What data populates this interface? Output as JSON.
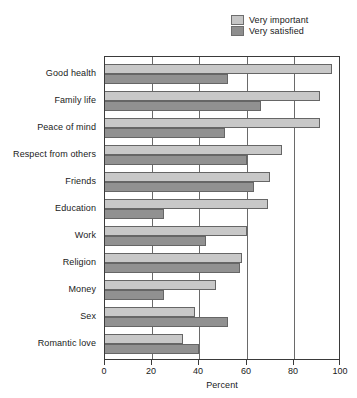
{
  "chart_data": {
    "type": "bar",
    "orientation": "horizontal",
    "title": "",
    "xlabel": "Percent",
    "ylabel": "",
    "xlim": [
      0,
      100
    ],
    "xticks": [
      0,
      20,
      40,
      60,
      80,
      100
    ],
    "xtick_labels": [
      "0",
      "20",
      "40",
      "60",
      "80",
      "100"
    ],
    "grid": true,
    "grid_axis": "x",
    "legend_position": "top-right",
    "categories": [
      "Good health",
      "Family life",
      "Peace of mind",
      "Respect from others",
      "Friends",
      "Education",
      "Work",
      "Religion",
      "Money",
      "Sex",
      "Romantic love"
    ],
    "series": [
      {
        "name": "Very important",
        "color": "#c8c8c8",
        "values": [
          96,
          91,
          91,
          75,
          70,
          69,
          60,
          58,
          47,
          38,
          33
        ]
      },
      {
        "name": "Very satisfied",
        "color": "#919191",
        "values": [
          52,
          66,
          51,
          60,
          63,
          25,
          43,
          57,
          25,
          52,
          40
        ]
      }
    ]
  },
  "legend": {
    "items": [
      {
        "label": "Very important",
        "swatch": "important"
      },
      {
        "label": "Very satisfied",
        "swatch": "satisfied"
      }
    ]
  },
  "colors": {
    "series_important": "#c8c8c8",
    "series_satisfied": "#919191",
    "axis": "#3a3a3a",
    "grid": "#6a6a6a",
    "background": "#ffffff",
    "text": "#1a1a1a"
  }
}
